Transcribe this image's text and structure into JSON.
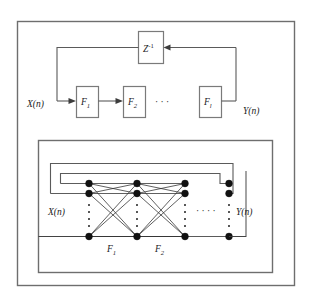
{
  "figure": {
    "name": "recurrent-multilayer-perceptron-diagram",
    "background_color": "#ffffff",
    "frame_color": "#6e6e6e",
    "line_color": "#5a5a5a",
    "node_color": "#111111"
  },
  "top_block_diagram": {
    "name": "block-level-recurrent-network",
    "input_label": "X(n)",
    "output_label": "Y(n)",
    "delay_block": {
      "label_base": "Z",
      "label_exponent": "-1"
    },
    "stages": [
      {
        "label_base": "F",
        "label_sub": "1"
      },
      {
        "label_base": "F",
        "label_sub": "2"
      },
      {
        "label_base": "F",
        "label_sub": "l"
      }
    ],
    "ellipsis": "·  ·  ·"
  },
  "bottom_network_diagram": {
    "name": "expanded-multilayer-perceptron",
    "input_label": "X(n)",
    "output_label": "Y(n)",
    "layer_labels": [
      {
        "label_base": "F",
        "label_sub": "1"
      },
      {
        "label_base": "F",
        "label_sub": "2"
      }
    ],
    "ellipsis": "·  ·  ·  ·",
    "node_columns": 4,
    "nodes_per_column": 3,
    "vertical_ellipsis": "⋮",
    "feedback_paths": 3
  }
}
